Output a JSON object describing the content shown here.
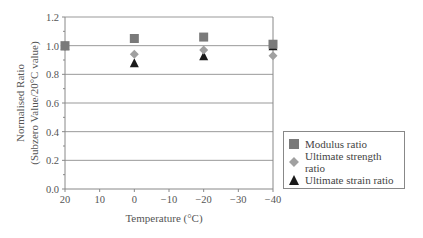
{
  "chart_data": {
    "type": "scatter",
    "title": "",
    "xlabel": "Temperature (°C)",
    "ylabel_line1": "Normalised Ratio",
    "ylabel_line2": "(Subzero Value/20°C value)",
    "x": [
      20,
      0,
      -20,
      -40
    ],
    "x_ticks": [
      "20",
      "10",
      "0",
      "−10",
      "−20",
      "−30",
      "−40"
    ],
    "x_tick_values": [
      20,
      10,
      0,
      -10,
      -20,
      -30,
      -40
    ],
    "y_ticks": [
      "0.0",
      "0.2",
      "0.4",
      "0.6",
      "0.8",
      "1.0",
      "1.2"
    ],
    "y_tick_values": [
      0,
      0.2,
      0.4,
      0.6,
      0.8,
      1.0,
      1.2
    ],
    "xlim": [
      20,
      -40
    ],
    "ylim": [
      0,
      1.2
    ],
    "grid": "horizontal",
    "legend_position": "right",
    "series": [
      {
        "name": "Modulus ratio",
        "marker": "square",
        "color": "#7a7a7a",
        "values": [
          1.0,
          1.05,
          1.06,
          1.01
        ]
      },
      {
        "name": "Ultimate strength ratio",
        "marker": "diamond",
        "color": "#a0a0a0",
        "values": [
          1.0,
          0.94,
          0.97,
          0.93
        ]
      },
      {
        "name": "Ultimate strain ratio",
        "marker": "triangle",
        "color": "#1a1a1a",
        "values": [
          1.0,
          0.88,
          0.93,
          1.0
        ]
      }
    ]
  }
}
